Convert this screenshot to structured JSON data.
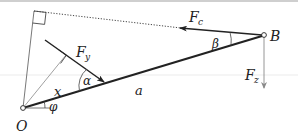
{
  "diagram": {
    "type": "mechanics-force-diagram",
    "points": {
      "origin": {
        "label": "O",
        "x": 23,
        "y": 108
      },
      "end": {
        "label": "B",
        "x": 264,
        "y": 35
      }
    },
    "labels": {
      "O": "O",
      "B": "B",
      "a": "a",
      "x": "x",
      "alpha": "α",
      "beta": "β",
      "phi": "φ",
      "Fc_main": "F",
      "Fc_sub": "c",
      "Fy_main": "F",
      "Fy_sub": "y",
      "Fz_main": "F",
      "Fz_sub": "z"
    },
    "colors": {
      "ink": "#222222",
      "thin": "#555555",
      "gray_arrow": "#8a8a8a",
      "faint_line": "#d8d8d8"
    },
    "elements": [
      {
        "name": "beam-a",
        "from": "O",
        "to": "B",
        "style": "thick"
      },
      {
        "name": "force-Fc",
        "from": "B",
        "to": [
          180,
          28
        ],
        "style": "arrow"
      },
      {
        "name": "line-of-action-Fc",
        "from": [
          180,
          28
        ],
        "to": [
          34,
          11
        ],
        "style": "dotted"
      },
      {
        "name": "lever-arm-Fc",
        "from": "O",
        "to": [
          34,
          11
        ],
        "style": "thin"
      },
      {
        "name": "force-Fy",
        "from": [
          45,
          40
        ],
        "to": [
          105,
          83
        ],
        "style": "arrow"
      },
      {
        "name": "lever-arm-Fy",
        "from": "O",
        "to": [
          66,
          54
        ],
        "style": "thin-gray"
      },
      {
        "name": "force-Fz",
        "from": "B",
        "to": [
          264,
          88
        ],
        "style": "gray-arrow"
      }
    ]
  }
}
